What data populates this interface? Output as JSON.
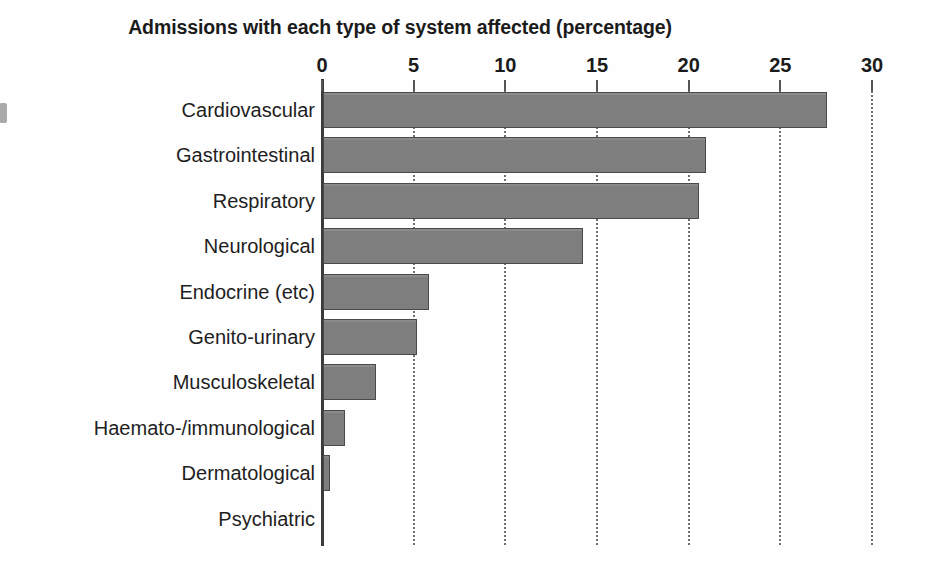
{
  "chart_data": {
    "type": "bar",
    "orientation": "horizontal",
    "title": "Admissions with each type of system affected (percentage)",
    "xlabel": "",
    "ylabel": "",
    "xlim": [
      0,
      30
    ],
    "xticks": [
      0,
      5,
      10,
      15,
      20,
      25,
      30
    ],
    "xtick_labels": [
      "0",
      "5",
      "10",
      "15",
      "20",
      "25",
      "30"
    ],
    "grid": "vertical-dotted",
    "legend": "none",
    "bar_color": "#7e7e7e",
    "bar_edge_color": "#4a4a4a",
    "categories": [
      "Cardiovascular",
      "Gastrointestinal",
      "Respiratory",
      "Neurological",
      "Endocrine (etc)",
      "Genito-urinary",
      "Musculoskeletal",
      "Haemato-/immunological",
      "Dermatological",
      "Psychiatric"
    ],
    "values": [
      27.5,
      20.9,
      20.5,
      14.2,
      5.8,
      5.1,
      2.9,
      1.2,
      0.4,
      0.0
    ]
  }
}
